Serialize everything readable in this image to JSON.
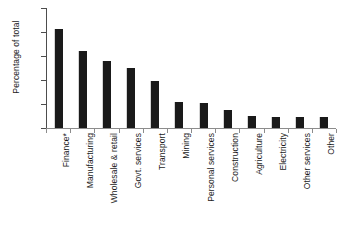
{
  "chart_data": {
    "type": "bar",
    "title": "",
    "xlabel": "",
    "ylabel": "Percentage of total",
    "ylim": [
      0,
      25
    ],
    "yticks": [
      0,
      5,
      10,
      15,
      20,
      25
    ],
    "grid": false,
    "legend": null,
    "bar_color": "#1a1a1a",
    "axis_color": "#4d4d4d",
    "background": "#ffffff",
    "categories": [
      "Finance*",
      "Manufacturing",
      "Wholesale & retail",
      "Govt. services",
      "Transport",
      "Mining",
      "Personal services",
      "Construction",
      "Agriculture",
      "Electricity",
      "Other services",
      "Other"
    ],
    "values": [
      20.7,
      16.0,
      14.0,
      12.4,
      9.8,
      5.5,
      5.3,
      3.7,
      2.4,
      2.3,
      2.3,
      2.3
    ]
  }
}
